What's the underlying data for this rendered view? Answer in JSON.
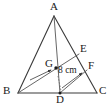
{
  "figure": {
    "type": "geometry-diagram",
    "shape": "triangle",
    "background_color": "#ffffff",
    "stroke_color": "#3a3a3a",
    "text_color": "#1a1a1a",
    "vertices": [
      {
        "id": "A",
        "label": "A",
        "x": 54,
        "y": 16,
        "label_x": 50,
        "label_y": 2
      },
      {
        "id": "B",
        "label": "B",
        "x": 18,
        "y": 93,
        "label_x": 4,
        "label_y": 87
      },
      {
        "id": "C",
        "label": "C",
        "x": 97,
        "y": 93,
        "label_x": 99,
        "label_y": 87
      },
      {
        "id": "D",
        "label": "D",
        "x": 60,
        "y": 93,
        "label_x": 56,
        "label_y": 95
      },
      {
        "id": "E",
        "label": "E",
        "x": 79,
        "y": 54,
        "label_x": 80,
        "label_y": 45
      },
      {
        "id": "F",
        "label": "F",
        "x": 87,
        "y": 70,
        "label_x": 88,
        "label_y": 62
      },
      {
        "id": "G",
        "label": "G",
        "x": 56,
        "y": 68,
        "label_x": 46,
        "label_y": 59
      }
    ],
    "segments": [
      {
        "name": "side-AB",
        "from": "A",
        "to": "B"
      },
      {
        "name": "side-AC",
        "from": "A",
        "to": "C"
      },
      {
        "name": "side-BC",
        "from": "B",
        "to": "C"
      },
      {
        "name": "median-AD",
        "from": "A",
        "to": "D"
      },
      {
        "name": "cevian-BE",
        "from": "B",
        "to": "E"
      },
      {
        "name": "segment-DF",
        "from": "D",
        "to": "F"
      }
    ],
    "points_marked": [
      "G",
      "D"
    ],
    "measurement": {
      "label": "8 cm",
      "x": 58,
      "y": 67
    },
    "arrows": [
      {
        "name": "arrow-to-centroid",
        "from_x": 30,
        "from_y": 80,
        "to_x": 53,
        "to_y": 70
      },
      {
        "name": "arrow-to-f",
        "from_x": 62,
        "from_y": 88,
        "to_x": 82,
        "to_y": 73
      }
    ],
    "dashed_marks": [
      {
        "name": "dashed-mark-at-d",
        "x1": 58,
        "y1": 76,
        "x2": 61,
        "y2": 91
      }
    ]
  }
}
